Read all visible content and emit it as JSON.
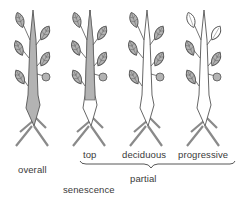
{
  "labels": {
    "overall": "overall",
    "top": "top",
    "deciduous": "deciduous",
    "progressive": "progressive",
    "partial": "partial",
    "senescence": "senescence"
  },
  "colors": {
    "fill": "#b3b3b3",
    "stroke": "#555555",
    "text": "#3a3a3a"
  },
  "plants": [
    {
      "name": "overall",
      "stem": "fully-shaded",
      "leaves": "all-shaded"
    },
    {
      "name": "top",
      "stem": "upper-shaded",
      "leaves": "all-shaded"
    },
    {
      "name": "deciduous",
      "stem": "unshaded",
      "leaves": "all-shaded"
    },
    {
      "name": "progressive",
      "stem": "unshaded",
      "leaves": "upper-unshaded"
    }
  ]
}
